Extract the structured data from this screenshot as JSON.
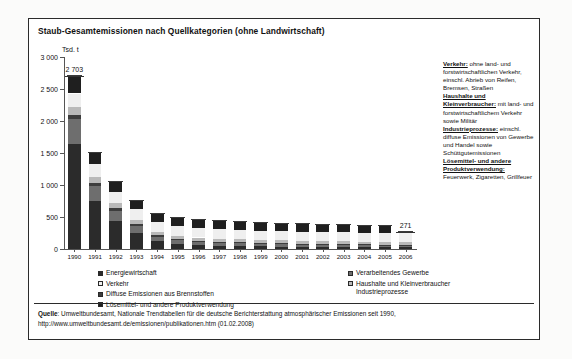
{
  "title": "Staub-Gesamtemissionen nach Quellkategorien (ohne Landwirtschaft)",
  "unit": "Tsd. t",
  "legend": {
    "left": [
      {
        "label": "Energiewirtschaft",
        "color": "#2b2b2b"
      },
      {
        "label": "Verkehr",
        "color": "#efefef"
      },
      {
        "label": "Diffuse Emissionen aus Brennstoffen",
        "color": "#3d3d3d"
      },
      {
        "label": "Lösemittel- und andere Produktverwendung",
        "color": "#1f1f1f"
      }
    ],
    "right": [
      {
        "label": "Verarbeitendes Gewerbe",
        "color": "#6e6e6e"
      },
      {
        "label": "Haushalte und Kleinverbraucher",
        "color": "#b9b9b9",
        "cont": "Industrieprozesse"
      }
    ]
  },
  "notes": [
    {
      "head": "Verkehr:",
      "text": " ohne land- und forstwirtschaftlichen Verkehr, einschl. Abrieb von Reifen, Bremsen, Straßen"
    },
    {
      "head": "Haushalte und Kleinverbraucher:",
      "text": " mit land- und forstwirtschaftlichem Verkehr sowie Militär"
    },
    {
      "head": "Industrieprozesse:",
      "text": " einschl. diffuse Emissionen von Gewerbe und Handel sowie Schüttgutemissionen"
    },
    {
      "head": "Lösemittel- und andere Produktverwendung:",
      "text": " Feuerwerk, Zigaretten, Grillfeuer"
    }
  ],
  "source": {
    "prefix": "Quelle",
    "line1": ": Umweltbundesamt, Nationale Trendtabellen für die deutsche Berichterstattung atmosphärischer Emissionen seit 1990,",
    "line2": "http://www.umweltbundesamt.de/emissionen/publikationen.htm (01.02.2008)"
  },
  "chart_data": {
    "type": "bar",
    "stacked": true,
    "title": "Staub-Gesamtemissionen nach Quellkategorien (ohne Landwirtschaft)",
    "xlabel": "",
    "ylabel": "Tsd. t",
    "ylim": [
      0,
      3000
    ],
    "yticks": [
      0,
      500,
      1000,
      1500,
      2000,
      2500,
      3000
    ],
    "ytick_labels": [
      "0",
      "500",
      "1 000",
      "1 500",
      "2 000",
      "2 500",
      "3 000"
    ],
    "grid": false,
    "legend_position": "bottom",
    "categories": [
      "1990",
      "1991",
      "1992",
      "1993",
      "1994",
      "1995",
      "1996",
      "1997",
      "1998",
      "1999",
      "2000",
      "2001",
      "2002",
      "2003",
      "2004",
      "2005",
      "2006"
    ],
    "series": [
      {
        "name": "Energiewirtschaft",
        "color": "#2b2b2b",
        "values": [
          1640,
          750,
          440,
          250,
          120,
          80,
          60,
          50,
          45,
          40,
          36,
          33,
          30,
          28,
          26,
          25,
          24
        ]
      },
      {
        "name": "Verarbeitendes Gewerbe",
        "color": "#6e6e6e",
        "values": [
          390,
          240,
          160,
          110,
          75,
          62,
          56,
          52,
          48,
          45,
          43,
          41,
          39,
          37,
          36,
          35,
          34
        ]
      },
      {
        "name": "Diffuse Emissionen aus Brennstoffen",
        "color": "#3d3d3d",
        "values": [
          60,
          48,
          38,
          28,
          20,
          17,
          15,
          14,
          13,
          12,
          11,
          11,
          10,
          10,
          9,
          9,
          9
        ]
      },
      {
        "name": "Haushalte und Kleinverbraucher Industrieprozesse",
        "color": "#b9b9b9",
        "values": [
          125,
          95,
          78,
          62,
          52,
          50,
          49,
          48,
          47,
          46,
          46,
          45,
          45,
          44,
          44,
          44,
          44
        ]
      },
      {
        "name": "Verkehr",
        "color": "#efefef",
        "values": [
          215,
          190,
          178,
          168,
          158,
          155,
          152,
          150,
          148,
          146,
          145,
          143,
          142,
          141,
          140,
          139,
          138
        ]
      },
      {
        "name": "Lösemittel- und andere Produktverwendung",
        "color": "#1f1f1f",
        "values": [
          273,
          182,
          146,
          127,
          120,
          118,
          117,
          116,
          115,
          114,
          113,
          112,
          112,
          111,
          111,
          110,
          22
        ]
      }
    ],
    "totals": [
      2703,
      1505,
      1040,
      745,
      545,
      482,
      449,
      430,
      416,
      403,
      394,
      385,
      378,
      371,
      366,
      362,
      271
    ],
    "annotations": [
      {
        "category": "1990",
        "value": 2703,
        "label": "2 703"
      },
      {
        "category": "2006",
        "value": 271,
        "label": "271"
      }
    ]
  }
}
